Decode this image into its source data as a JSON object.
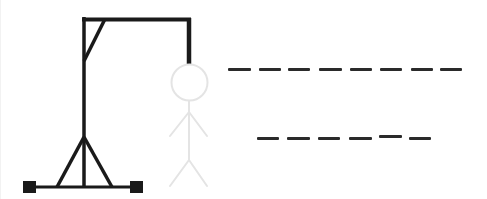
{
  "game": {
    "type": "hangman",
    "colors": {
      "gallows": "#1a1a1a",
      "figure_hidden": "#e4e4e4",
      "slot": "#2a2a2a",
      "background": "#ffffff"
    },
    "gallows": {
      "parts": [
        "base",
        "left-foot",
        "right-foot",
        "post",
        "left-support",
        "right-support",
        "beam",
        "brace",
        "rope"
      ]
    },
    "figure": {
      "parts": [
        "head",
        "body",
        "left-arm",
        "right-arm",
        "left-leg",
        "right-leg"
      ],
      "revealed_parts": 0,
      "state": "not-drawn"
    },
    "puzzle": {
      "words": [
        {
          "length": 8,
          "letters": [
            "",
            "",
            "",
            "",
            "",
            "",
            "",
            ""
          ]
        },
        {
          "length": 6,
          "letters": [
            "",
            "",
            "",
            "",
            "",
            ""
          ]
        }
      ]
    }
  }
}
